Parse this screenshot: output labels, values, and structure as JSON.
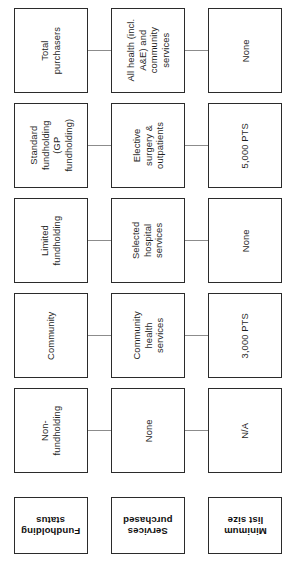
{
  "diagram": {
    "orientation": "rotated-90",
    "headers": [
      {
        "id": "fundholding-status",
        "label": "Fundholding\nstatus"
      },
      {
        "id": "services-purchased",
        "label": "Services\npurchased"
      },
      {
        "id": "minimum-list-size",
        "label": "Minimum\nlist size"
      }
    ],
    "rows": [
      {
        "id": "total-purchasers",
        "fundholding_status": "Total\npurchasers",
        "services_purchased": "All health (incl.\nA&E) and\ncommunity\nservices",
        "minimum_list_size": "None"
      },
      {
        "id": "standard-fundholding",
        "fundholding_status": "Standard\nfundholding\n(GP\nfundholding)",
        "services_purchased": "Elective\nsurgery &\noutpatients",
        "minimum_list_size": "5,000 PTS"
      },
      {
        "id": "limited-fundholding",
        "fundholding_status": "Limited\nfundholding",
        "services_purchased": "Selected\nhospital\nservices",
        "minimum_list_size": "None"
      },
      {
        "id": "community",
        "fundholding_status": "Community",
        "services_purchased": "Community\nhealth\nservices",
        "minimum_list_size": "3,000 PTS"
      },
      {
        "id": "non-fundholding",
        "fundholding_status": "Non-\nfundholding",
        "services_purchased": "None",
        "minimum_list_size": "N/A"
      }
    ],
    "colors": {
      "background": "#ffffff",
      "box_border": "#2b2b2b",
      "connector": "#8c8c8c",
      "text": "#1f1f1f",
      "header_text": "#101010"
    }
  }
}
